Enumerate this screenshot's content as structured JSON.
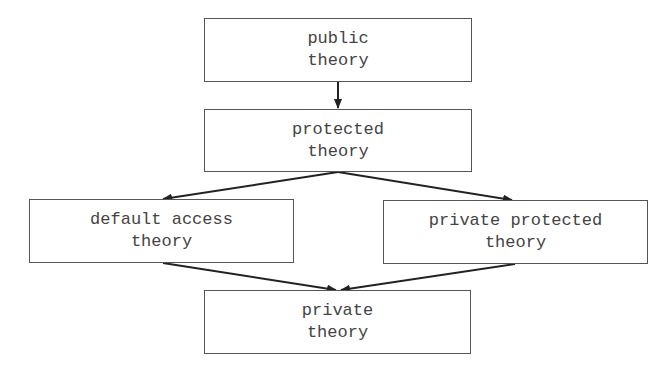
{
  "diagram": {
    "type": "hierarchy",
    "nodes": [
      {
        "id": "public",
        "line1": "public",
        "line2": "theory"
      },
      {
        "id": "protected",
        "line1": "protected",
        "line2": "theory"
      },
      {
        "id": "default",
        "line1": "default access",
        "line2": "theory"
      },
      {
        "id": "private_protected",
        "line1": "private protected",
        "line2": "theory"
      },
      {
        "id": "private",
        "line1": "private",
        "line2": "theory"
      }
    ],
    "edges": [
      {
        "from": "public",
        "to": "protected"
      },
      {
        "from": "protected",
        "to": "default"
      },
      {
        "from": "protected",
        "to": "private_protected"
      },
      {
        "from": "default",
        "to": "private"
      },
      {
        "from": "private_protected",
        "to": "private"
      }
    ]
  }
}
